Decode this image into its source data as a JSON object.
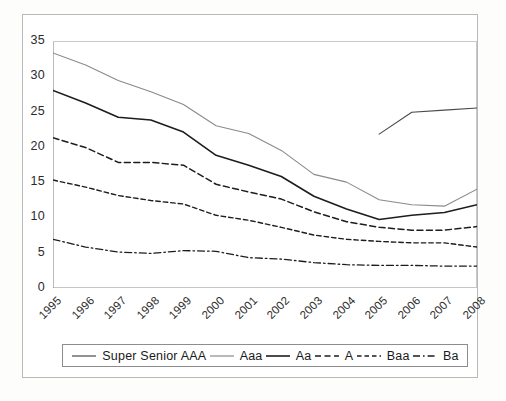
{
  "chart_data": {
    "type": "line",
    "title": "",
    "subtitle": "",
    "xlabel": "",
    "ylabel": "",
    "xlim": [
      1995,
      2008
    ],
    "ylim": [
      0,
      35
    ],
    "yticks": [
      0,
      5,
      10,
      15,
      20,
      25,
      30,
      35
    ],
    "grid": false,
    "legend_position": "bottom",
    "categories": [
      "1995",
      "1996",
      "1997",
      "1998",
      "1999",
      "2000",
      "2001",
      "2002",
      "2003",
      "2004",
      "2005",
      "2006",
      "2007",
      "2008"
    ],
    "series": [
      {
        "name": "Super Senior AAA",
        "style": "solid",
        "color": "#4a4a4a",
        "width": 1.1,
        "x": [
          "2005",
          "2006",
          "2007",
          "2008"
        ],
        "values": [
          21.8,
          24.9,
          25.2,
          25.5
        ]
      },
      {
        "name": "Aaa",
        "style": "solid",
        "color": "#8a8a8a",
        "width": 1.1,
        "x": [
          "1995",
          "1996",
          "1997",
          "1998",
          "1999",
          "2000",
          "2001",
          "2002",
          "2003",
          "2004",
          "2005",
          "2006",
          "2007",
          "2008"
        ],
        "values": [
          33.3,
          31.6,
          29.4,
          27.8,
          26.0,
          23.0,
          21.9,
          19.5,
          16.1,
          15.0,
          12.5,
          11.8,
          11.6,
          14.0
        ]
      },
      {
        "name": "Aa",
        "style": "solid",
        "color": "#1d1d1d",
        "width": 1.6,
        "x": [
          "1995",
          "1996",
          "1997",
          "1998",
          "1999",
          "2000",
          "2001",
          "2002",
          "2003",
          "2004",
          "2005",
          "2006",
          "2007",
          "2008"
        ],
        "values": [
          28.0,
          26.2,
          24.2,
          23.8,
          22.1,
          18.8,
          17.4,
          15.8,
          13.0,
          11.2,
          9.7,
          10.3,
          10.7,
          11.8
        ]
      },
      {
        "name": "A",
        "style": "dashed",
        "color": "#1d1d1d",
        "width": 1.5,
        "x": [
          "1995",
          "1996",
          "1997",
          "1998",
          "1999",
          "2000",
          "2001",
          "2002",
          "2003",
          "2004",
          "2005",
          "2006",
          "2007",
          "2008"
        ],
        "values": [
          21.3,
          19.9,
          17.8,
          17.8,
          17.4,
          14.7,
          13.6,
          12.6,
          10.8,
          9.4,
          8.6,
          8.2,
          8.2,
          8.7
        ]
      },
      {
        "name": "Baa",
        "style": "dashed-fine",
        "color": "#1d1d1d",
        "width": 1.4,
        "x": [
          "1995",
          "1996",
          "1997",
          "1998",
          "1999",
          "2000",
          "2001",
          "2002",
          "2003",
          "2004",
          "2005",
          "2006",
          "2007",
          "2008"
        ],
        "values": [
          15.3,
          14.3,
          13.1,
          12.4,
          11.9,
          10.3,
          9.6,
          8.6,
          7.5,
          6.9,
          6.6,
          6.4,
          6.4,
          5.8
        ]
      },
      {
        "name": "Ba",
        "style": "dashdot",
        "color": "#1d1d1d",
        "width": 1.3,
        "x": [
          "1995",
          "1996",
          "1997",
          "1998",
          "1999",
          "2000",
          "2001",
          "2002",
          "2003",
          "2004",
          "2005",
          "2006",
          "2007",
          "2008"
        ],
        "values": [
          6.9,
          5.8,
          5.1,
          4.9,
          5.3,
          5.2,
          4.3,
          4.1,
          3.6,
          3.3,
          3.2,
          3.2,
          3.1,
          3.1
        ]
      }
    ]
  },
  "legend": {
    "entries": [
      {
        "label": "Super Senior AAA"
      },
      {
        "label": "Aaa"
      },
      {
        "label": "Aa"
      },
      {
        "label": "A"
      },
      {
        "label": "Baa"
      },
      {
        "label": "Ba"
      }
    ]
  }
}
